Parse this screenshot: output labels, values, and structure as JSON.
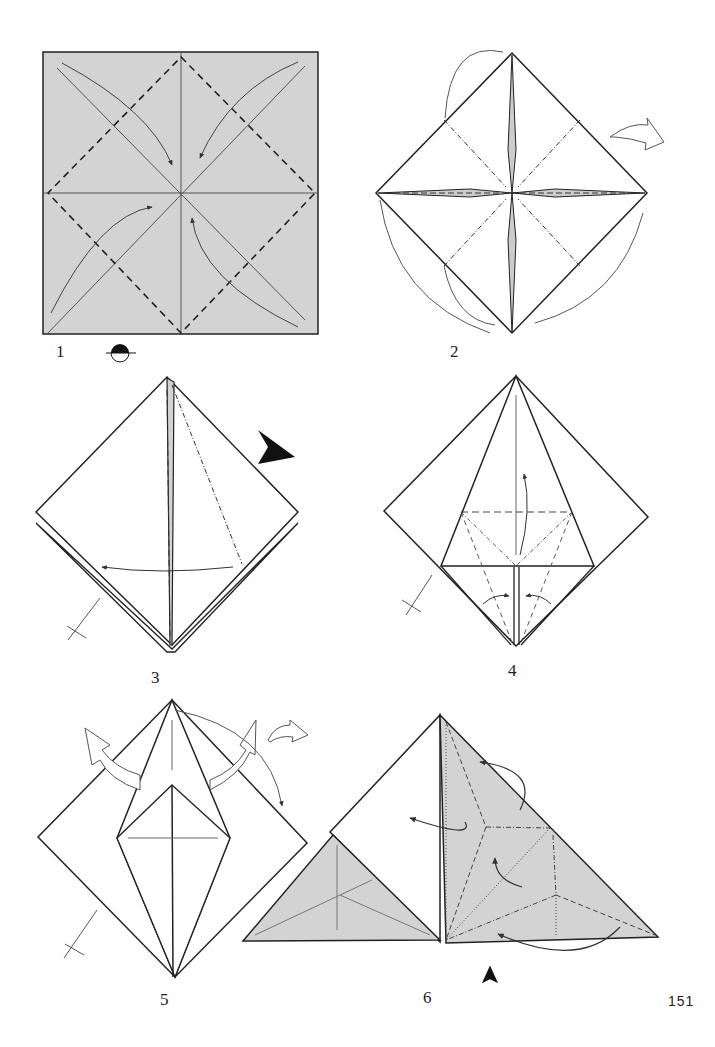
{
  "page": {
    "page_number": "151",
    "colors": {
      "paper_colored": "#d3d3d3",
      "paper_white": "#ffffff",
      "line": "#1a1a1a",
      "arrow": "#555555"
    }
  },
  "steps": [
    {
      "number": "1",
      "description": "Square with valley-fold diagonals and dashed diamond; fold corners to center; turn over symbol"
    },
    {
      "number": "2",
      "description": "Blintzed square with mountain folds; corners folded behind"
    },
    {
      "number": "3",
      "description": "Squash fold with mountain fold line and black push arrow"
    },
    {
      "number": "4",
      "description": "Kite with petal fold lines; valley and mountain fold marks"
    },
    {
      "number": "5",
      "description": "Petal-folded shape with hollow arrows opening flaps"
    },
    {
      "number": "6",
      "description": "Shaded triangle with crease pattern; push arrow at bottom"
    }
  ],
  "symbols": {
    "turn_over": "turn-over-icon",
    "push": "push-arrow-icon",
    "repeat": "repeat-behind-icon"
  }
}
